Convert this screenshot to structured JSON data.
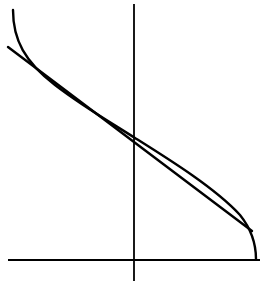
{
  "diagram": {
    "type": "function-graph-with-linear-approximation",
    "background": "#ffffff",
    "stroke_color": "#000000",
    "axes": {
      "x_axis": {
        "x1": 8,
        "y1": 260,
        "x2": 260,
        "y2": 260
      },
      "y_axis": {
        "x1": 134,
        "y1": 4,
        "x2": 134,
        "y2": 281
      }
    },
    "curve": {
      "description": "Decreasing S-shaped curve with vertical tangents at both ends",
      "path": "M 13 10 C 13 40, 25 62, 55 85 C 85 108, 115 125, 135 138 C 170 160, 215 188, 240 215 C 252 230, 256 245, 256 259"
    },
    "tangent_line": {
      "description": "Straight line approximating the curve through its center",
      "x1": 8,
      "y1": 47,
      "x2": 252,
      "y2": 231
    }
  }
}
